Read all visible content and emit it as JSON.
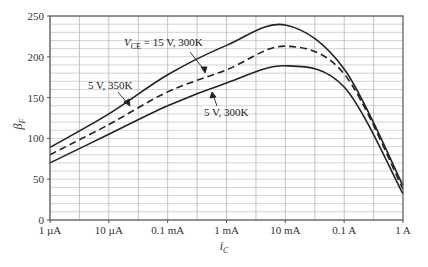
{
  "chart_data": {
    "type": "line",
    "title": "",
    "xlabel": "i_C",
    "ylabel": "β_F",
    "x_scale": "log",
    "x_tick_labels": [
      "1 µA",
      "10 µA",
      "0.1 mA",
      "1 mA",
      "10 mA",
      "0.1 A",
      "1 A"
    ],
    "x_ticks_A": [
      1e-06,
      1e-05,
      0.0001,
      0.001,
      0.01,
      0.1,
      1
    ],
    "xlim_A": [
      1e-06,
      1
    ],
    "y_ticks": [
      0,
      50,
      100,
      150,
      200,
      250
    ],
    "ylim": [
      0,
      250
    ],
    "grid": true,
    "grid_minor_y_step": 10,
    "legend": "none (inline annotations with arrows)",
    "x": [
      1e-06,
      1e-05,
      0.0001,
      0.001,
      0.01,
      0.1,
      1
    ],
    "series": [
      {
        "name": "5 V, 350K",
        "style": "solid",
        "values": [
          89,
          130,
          178,
          214,
          239,
          185,
          42
        ]
      },
      {
        "name": "V_CE = 15 V, 300K",
        "style": "dashed",
        "values": [
          80,
          117,
          157,
          184,
          213,
          179,
          38
        ]
      },
      {
        "name": "5 V, 300K",
        "style": "solid",
        "values": [
          70,
          105,
          140,
          168,
          189,
          163,
          32
        ]
      }
    ],
    "annotations": [
      {
        "text_main": "V",
        "text_sub": "CE",
        "text_rest": " = 15 V, 300K",
        "points_to": "dashed curve"
      },
      {
        "text": "5 V, 350K",
        "points_to": "upper solid curve"
      },
      {
        "text": "5 V, 300K",
        "points_to": "lower solid curve"
      }
    ]
  },
  "labels": {
    "ylabel_main": "β",
    "ylabel_sub": "F",
    "xlabel_main": "i",
    "xlabel_sub": "C",
    "ann1_main": "V",
    "ann1_sub": "CE",
    "ann1_rest": " = 15 V, 300K",
    "ann2": "5 V, 350K",
    "ann3": "5 V, 300K"
  }
}
